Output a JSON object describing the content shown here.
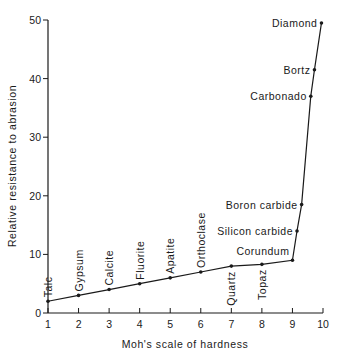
{
  "chart_data": {
    "type": "line",
    "title": "",
    "xlabel": "Moh's scale of hardness",
    "ylabel": "Relative resistance to abrasion",
    "xlim": [
      1,
      10
    ],
    "ylim": [
      0,
      50
    ],
    "x_ticks": [
      "1",
      "2",
      "3",
      "4",
      "5",
      "6",
      "7",
      "8",
      "9",
      "10"
    ],
    "y_ticks": [
      "0",
      "10",
      "20",
      "30",
      "40",
      "50"
    ],
    "grid": false,
    "legend": null,
    "series": [
      {
        "name": "Minerals",
        "points": [
          {
            "label": "Talc",
            "x": 1,
            "y": 2
          },
          {
            "label": "Gypsum",
            "x": 2,
            "y": 3
          },
          {
            "label": "Calcite",
            "x": 3,
            "y": 4
          },
          {
            "label": "Fluorite",
            "x": 4,
            "y": 5
          },
          {
            "label": "Apatite",
            "x": 5,
            "y": 6
          },
          {
            "label": "Orthoclase",
            "x": 6,
            "y": 7
          },
          {
            "label": "Quartz",
            "x": 7,
            "y": 8
          },
          {
            "label": "Topaz",
            "x": 8,
            "y": 8.3
          },
          {
            "label": "Corundum",
            "x": 9,
            "y": 9
          },
          {
            "label": "Silicon carbide",
            "x": 9.15,
            "y": 14
          },
          {
            "label": "Boron carbide",
            "x": 9.3,
            "y": 18.5
          },
          {
            "label": "Carbonado",
            "x": 9.6,
            "y": 37
          },
          {
            "label": "Bortz",
            "x": 9.72,
            "y": 41.5
          },
          {
            "label": "Diamond",
            "x": 9.95,
            "y": 49.5
          }
        ]
      }
    ]
  }
}
